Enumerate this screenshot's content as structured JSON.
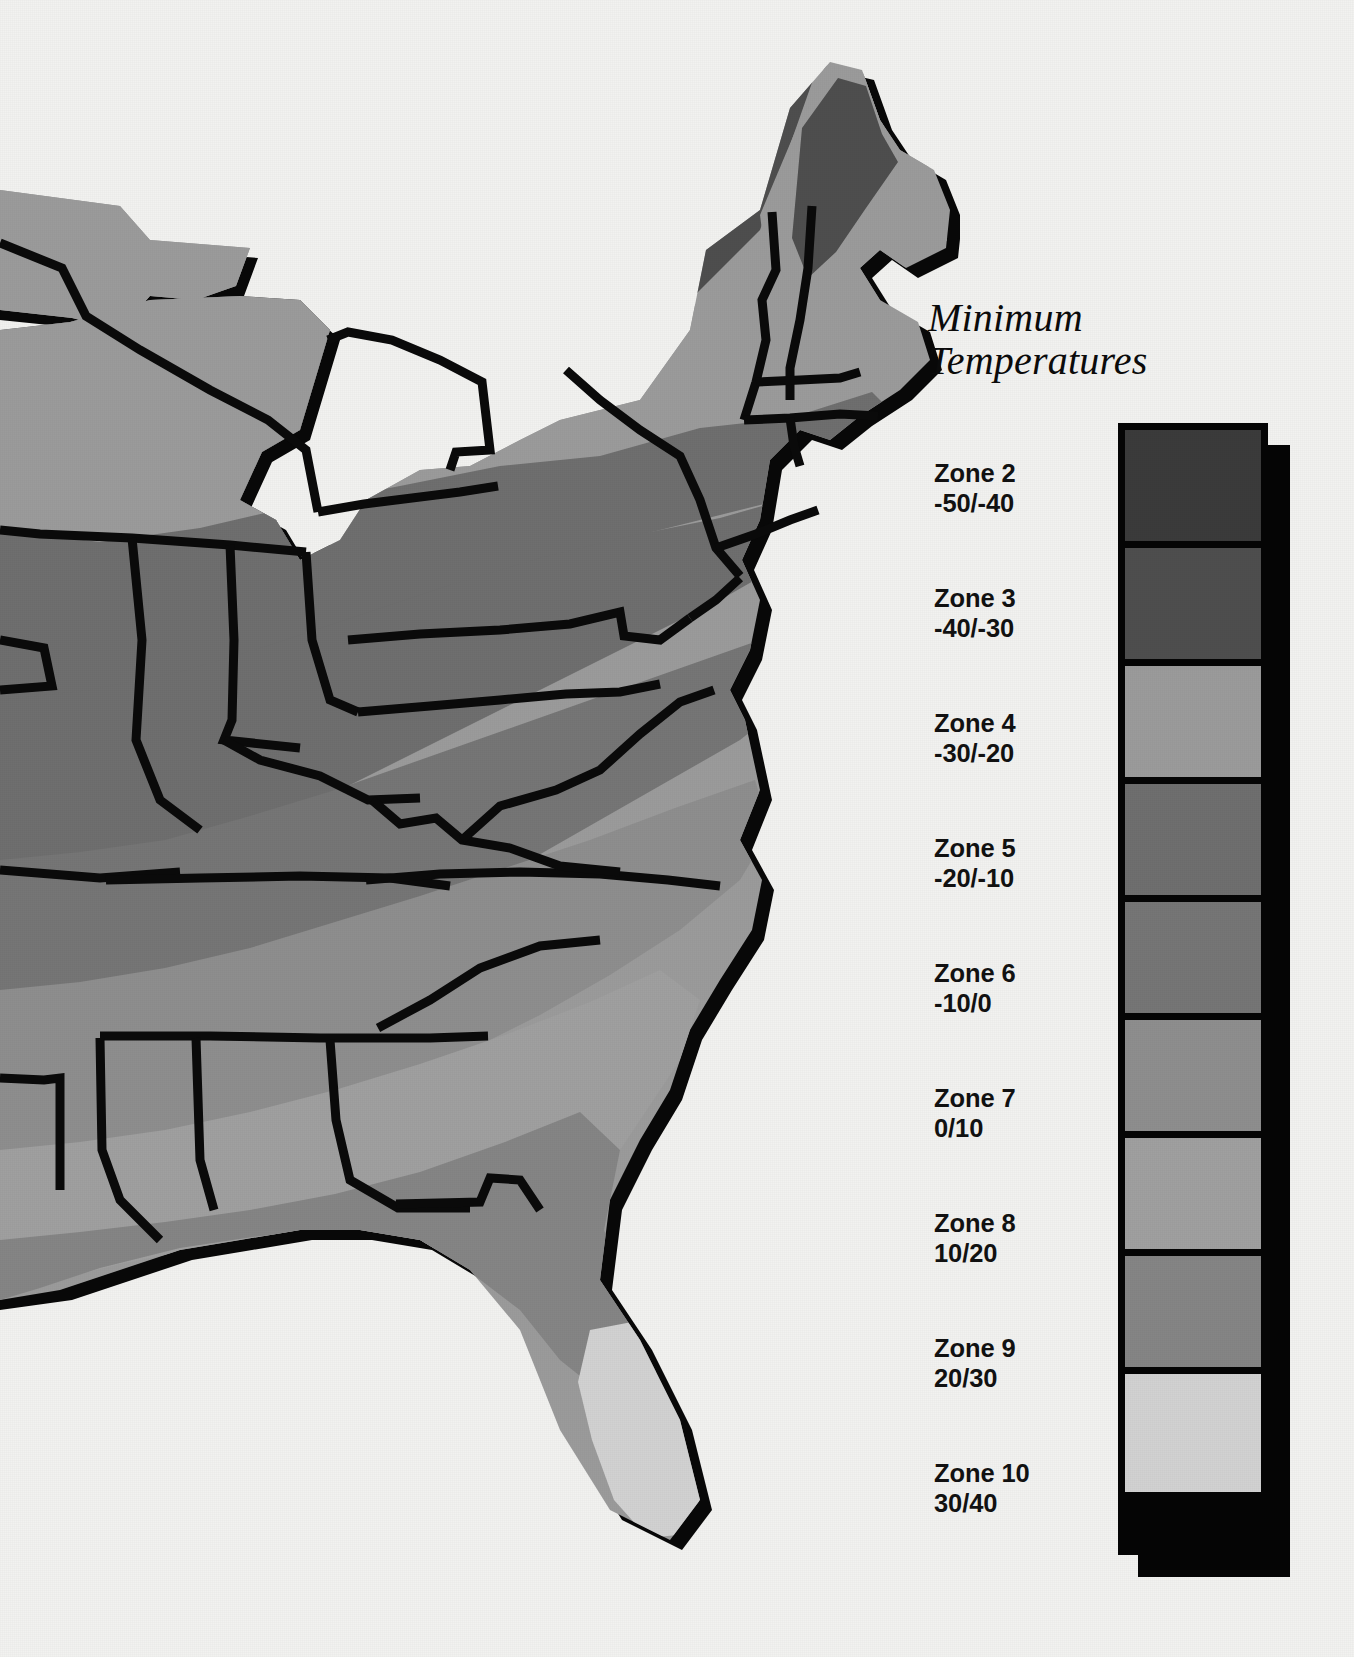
{
  "page": {
    "background_color": "#f2f2f0",
    "width": 1354,
    "height": 1657
  },
  "legend": {
    "title_line1": "Minimum",
    "title_line2": "Temperatures",
    "frame_color": "#050505",
    "shadow_color": "#050505",
    "items": [
      {
        "zone_label": "Zone 2",
        "range_label": "-50/-40",
        "color": "#3b3b3b",
        "swatch_height": 118
      },
      {
        "zone_label": "Zone 3",
        "range_label": "-40/-30",
        "color": "#4e4e4e",
        "swatch_height": 118
      },
      {
        "zone_label": "Zone 4",
        "range_label": "-30/-20",
        "color": "#9b9b9b",
        "swatch_height": 118
      },
      {
        "zone_label": "Zone 5",
        "range_label": "-20/-10",
        "color": "#6f6f6f",
        "swatch_height": 118
      },
      {
        "zone_label": "Zone 6",
        "range_label": "-10/0",
        "color": "#767676",
        "swatch_height": 118
      },
      {
        "zone_label": "Zone 7",
        "range_label": "0/10",
        "color": "#8e8e8e",
        "swatch_height": 118
      },
      {
        "zone_label": "Zone 8",
        "range_label": "10/20",
        "color": "#a0a0a0",
        "swatch_height": 118
      },
      {
        "zone_label": "Zone 9",
        "range_label": "20/30",
        "color": "#858585",
        "swatch_height": 118
      },
      {
        "zone_label": "Zone 10",
        "range_label": "30/40",
        "color": "#d2d2d2",
        "swatch_height": 118
      }
    ]
  },
  "map": {
    "name": "eastern-united-states-plant-hardiness-zones",
    "description": "Shaded relief style thematic map of the eastern United States showing minimum temperature hardiness zones as gray bands, with heavy black state boundaries and a black cast shadow along the Atlantic and Gulf coastlines.",
    "land_base_color": "#9b9b9b",
    "border_color": "#0a0a0a",
    "coast_shadow_color": "#080808",
    "zone_band_colors": {
      "zone_3": "#4e4e4e",
      "zone_4": "#9b9b9b",
      "zone_5": "#6f6f6f",
      "zone_6": "#767676",
      "zone_7": "#8e8e8e",
      "zone_8": "#a0a0a0",
      "zone_9": "#858585",
      "zone_10": "#d2d2d2"
    }
  },
  "chart_data": {
    "type": "map",
    "title": "Minimum Temperatures",
    "legend_position": "right",
    "categories": [
      "Zone 2",
      "Zone 3",
      "Zone 4",
      "Zone 5",
      "Zone 6",
      "Zone 7",
      "Zone 8",
      "Zone 9",
      "Zone 10"
    ],
    "value_labels": [
      "-50/-40",
      "-40/-30",
      "-30/-20",
      "-20/-10",
      "-10/0",
      "0/10",
      "10/20",
      "20/30",
      "30/40"
    ],
    "units": "degrees Fahrenheit",
    "zone_min_values": [
      -50,
      -40,
      -30,
      -20,
      -10,
      0,
      10,
      20,
      30
    ],
    "zone_max_values": [
      -40,
      -30,
      -20,
      -10,
      0,
      10,
      20,
      30,
      40
    ],
    "swatch_colors": [
      "#3b3b3b",
      "#4e4e4e",
      "#9b9b9b",
      "#6f6f6f",
      "#767676",
      "#8e8e8e",
      "#a0a0a0",
      "#858585",
      "#d2d2d2"
    ]
  }
}
